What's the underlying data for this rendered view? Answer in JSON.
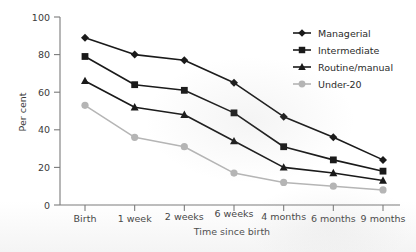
{
  "chart_data": {
    "type": "line",
    "title": "",
    "xlabel": "Time since birth",
    "ylabel": "Per cent",
    "categories": [
      "Birth",
      "1 week",
      "2 weeks",
      "6 weeks",
      "4 months",
      "6 months",
      "9 months"
    ],
    "ylim": [
      0,
      100
    ],
    "yticks": [
      0,
      20,
      40,
      60,
      80,
      100
    ],
    "grid": false,
    "legend_position": "top-right",
    "series": [
      {
        "name": "Managerial",
        "marker": "diamond",
        "color": "#1a1a1a",
        "values": [
          89,
          80,
          77,
          65,
          47,
          36,
          24
        ]
      },
      {
        "name": "Intermediate",
        "marker": "square",
        "color": "#1a1a1a",
        "values": [
          79,
          64,
          61,
          49,
          31,
          24,
          18
        ]
      },
      {
        "name": "Routine/manual",
        "marker": "triangle",
        "color": "#1a1a1a",
        "values": [
          66,
          52,
          48,
          34,
          20,
          17,
          13
        ]
      },
      {
        "name": "Under-20",
        "marker": "circle",
        "color": "#b5b5b5",
        "values": [
          53,
          36,
          31,
          17,
          12,
          10,
          8
        ]
      }
    ]
  },
  "axis": {
    "y_tick_labels": [
      "100",
      "80",
      "60",
      "40",
      "20",
      "0"
    ],
    "y_title": "Per cent",
    "x_title": "Time since birth",
    "x_tick_labels": [
      "Birth",
      "1 week",
      "2 weeks",
      "6 weeks",
      "4 months",
      "6 months",
      "9 months"
    ]
  },
  "legend": {
    "items": [
      {
        "label": "Managerial",
        "marker": "diamond-marker",
        "color": "#1a1a1a"
      },
      {
        "label": "Intermediate",
        "marker": "square-marker",
        "color": "#1a1a1a"
      },
      {
        "label": "Routine/manual",
        "marker": "triangle-marker",
        "color": "#1a1a1a"
      },
      {
        "label": "Under-20",
        "marker": "circle-marker",
        "color": "#b5b5b5"
      }
    ]
  },
  "colors": {
    "dark_series": "#1a1a1a",
    "light_series": "#b5b5b5",
    "axis": "#7a7a7a",
    "background": "#ffffff"
  }
}
